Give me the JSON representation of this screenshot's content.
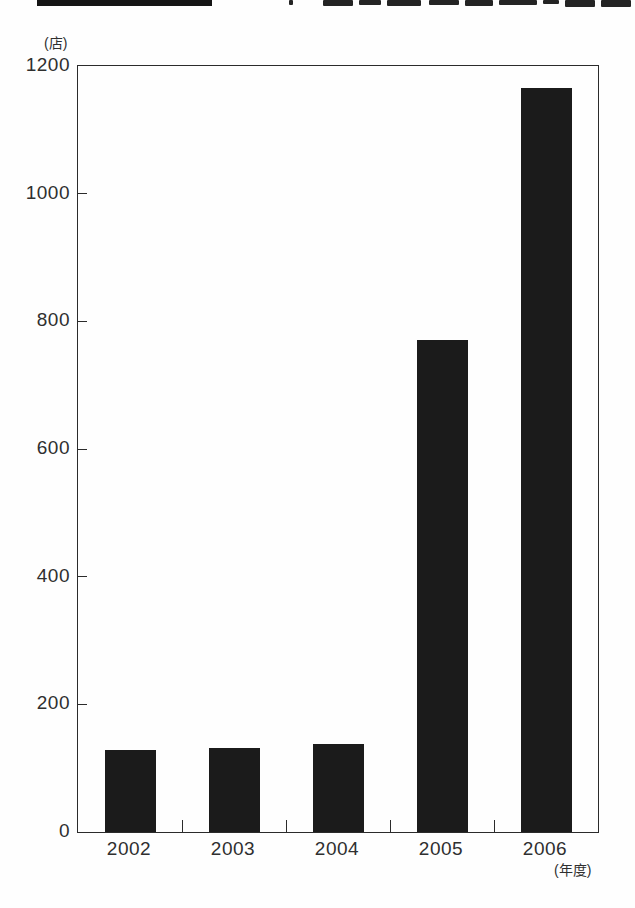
{
  "header": {
    "badge_color": "#151515"
  },
  "axes": {
    "y_unit_label": "(店)",
    "x_unit_label": "(年度)"
  },
  "chart_data": {
    "type": "bar",
    "categories": [
      "2002",
      "2003",
      "2004",
      "2005",
      "2006"
    ],
    "values": [
      128,
      132,
      138,
      770,
      1165
    ],
    "xlabel": "(年度)",
    "ylabel": "(店)",
    "ylim": [
      0,
      1200
    ],
    "yticks": [
      0,
      200,
      400,
      600,
      800,
      1000,
      1200
    ],
    "bar_color": "#1b1b1b",
    "grid": false,
    "legend": false,
    "frame": "full-box"
  }
}
